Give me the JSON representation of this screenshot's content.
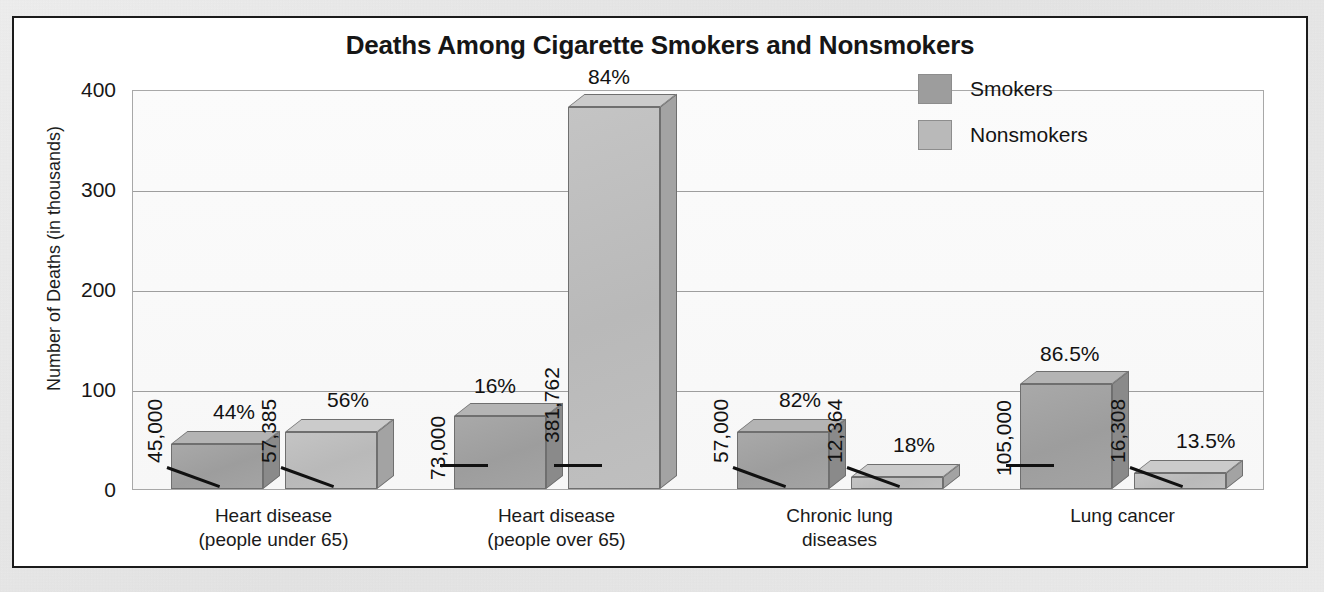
{
  "chart_data": {
    "type": "bar",
    "title": "Deaths Among Cigarette Smokers and Nonsmokers",
    "xlabel": "",
    "ylabel": "Number of Deaths (in thousands)",
    "ylim": [
      0,
      400
    ],
    "yticks": [
      "0",
      "100",
      "200",
      "300",
      "400"
    ],
    "grid": true,
    "legend_position": "upper-right",
    "categories": [
      "Heart disease\n(people under 65)",
      "Heart disease\n(people over 65)",
      "Chronic lung\ndiseases",
      "Lung cancer"
    ],
    "category_lines": [
      [
        "Heart disease",
        "(people under 65)"
      ],
      [
        "Heart disease",
        "(people over 65)"
      ],
      [
        "Chronic lung",
        "diseases"
      ],
      [
        "Lung cancer"
      ]
    ],
    "series": [
      {
        "name": "Smokers",
        "color": "#9d9d9d",
        "values": [
          45000,
          73000,
          57000,
          105000
        ],
        "value_labels": [
          "45,000",
          "73,000",
          "57,000",
          "105,000"
        ],
        "percent_labels": [
          "44%",
          "16%",
          "82%",
          "86.5%"
        ]
      },
      {
        "name": "Nonsmokers",
        "color": "#b9b9b9",
        "values": [
          57385,
          381762,
          12364,
          16308
        ],
        "value_labels": [
          "57,385",
          "381,762",
          "12,364",
          "16,308"
        ],
        "percent_labels": [
          "56%",
          "84%",
          "18%",
          "13.5%"
        ]
      }
    ]
  },
  "legend": {
    "items": [
      {
        "label": "Smokers",
        "color": "#9d9d9d"
      },
      {
        "label": "Nonsmokers",
        "color": "#b9b9b9"
      }
    ]
  }
}
